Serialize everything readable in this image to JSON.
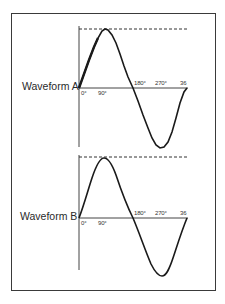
{
  "figure": {
    "panels": [
      {
        "label": "Waveform A",
        "ticks": {
          "t0": "0°",
          "t90": "90°",
          "t180": "180°",
          "t270": "270°",
          "t360": "36"
        }
      },
      {
        "label": "Waveform B",
        "ticks": {
          "t0": "0°",
          "t90": "90°",
          "t180": "180°",
          "t270": "270°",
          "t360": "36"
        }
      }
    ],
    "colors": {
      "line": "#1a1a1a",
      "border": "#3a3a3a",
      "dash": "#333333"
    }
  }
}
